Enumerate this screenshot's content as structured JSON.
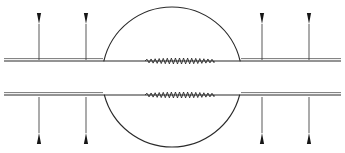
{
  "figure": {
    "background_color": "#ffffff",
    "line_color": "#1f1f1f",
    "arc_color": "#2a2a2a",
    "arrow_color": "#161616",
    "width": 345,
    "height": 153
  },
  "geometry": {
    "circle": {
      "label": "central-circular-hole",
      "center_x": 172,
      "center_y": 77,
      "radius": 70,
      "top_y": 7,
      "bottom_y": 147,
      "left_x": 102,
      "right_x": 242
    },
    "upper_member": {
      "label": "upper-member",
      "y": 61,
      "left_x": 4,
      "right_x": 341,
      "junction_left_x": 103,
      "junction_right_x": 241,
      "double_line_offset": 2.4
    },
    "lower_member": {
      "label": "lower-member",
      "y": 95,
      "left_x": 4,
      "right_x": 341,
      "junction_left_x": 103,
      "junction_right_x": 241,
      "double_line_offset": 2.4
    },
    "upper_crack": {
      "label": "upper-crack",
      "start_x": 145,
      "end_x": 214,
      "y": 61,
      "amplitude": 3.0,
      "cycles": 17
    },
    "lower_crack": {
      "label": "lower-crack",
      "start_x": 145,
      "end_x": 214,
      "y": 95,
      "amplitude": 3.0,
      "cycles": 17
    }
  },
  "load_arrows": {
    "upper": {
      "label": "tensile-load-up",
      "direction": "up",
      "tail_y": 60,
      "tip_y": 24,
      "head_length": 11,
      "head_half_width": 2.1,
      "x_positions": [
        39,
        86,
        262,
        309
      ]
    },
    "lower": {
      "label": "tensile-load-down",
      "direction": "down",
      "tail_y": 97,
      "tip_y": 133,
      "head_length": 11,
      "head_half_width": 2.1,
      "x_positions": [
        39,
        86,
        262,
        309
      ]
    }
  },
  "chart_data": {
    "type": "diagram",
    "elements": [
      {
        "name": "central-circle",
        "shape": "circle",
        "cx": 172,
        "cy": 77,
        "r": 70
      },
      {
        "name": "upper-member-left",
        "shape": "double-line",
        "x1": 4,
        "x2": 103,
        "y": 61
      },
      {
        "name": "upper-member-center",
        "shape": "single-line",
        "x1": 103,
        "x2": 241,
        "y": 61
      },
      {
        "name": "upper-member-right",
        "shape": "double-line",
        "x1": 241,
        "x2": 341,
        "y": 61
      },
      {
        "name": "lower-member-left",
        "shape": "double-line",
        "x1": 4,
        "x2": 103,
        "y": 95
      },
      {
        "name": "lower-member-center",
        "shape": "single-line",
        "x1": 103,
        "x2": 241,
        "y": 95
      },
      {
        "name": "lower-member-right",
        "shape": "double-line",
        "x1": 241,
        "x2": 341,
        "y": 95
      },
      {
        "name": "upper-crack",
        "shape": "zigzag",
        "x1": 145,
        "x2": 214,
        "y": 61
      },
      {
        "name": "lower-crack",
        "shape": "zigzag",
        "x1": 145,
        "x2": 214,
        "y": 95
      },
      {
        "name": "upper-arrows",
        "shape": "arrow-set",
        "count": 4,
        "direction": "up"
      },
      {
        "name": "lower-arrows",
        "shape": "arrow-set",
        "count": 4,
        "direction": "down"
      }
    ],
    "legend": [],
    "annotations": []
  }
}
